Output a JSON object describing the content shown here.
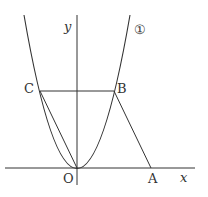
{
  "diagram": {
    "axes": {
      "x_label": "x",
      "y_label": "y",
      "origin_label": "O"
    },
    "curve_label": "①",
    "points": {
      "A": {
        "label": "A",
        "px": [
          151,
          168
        ]
      },
      "B": {
        "label": "B",
        "px": [
          114,
          91
        ]
      },
      "C": {
        "label": "C",
        "px": [
          40,
          91
        ]
      },
      "O": {
        "label": "O",
        "px": [
          77,
          168
        ]
      }
    },
    "segments": [
      "C-B",
      "B-A",
      "O-C",
      "O-B"
    ],
    "colors": {
      "stroke": "#333333",
      "background": "#ffffff"
    }
  }
}
